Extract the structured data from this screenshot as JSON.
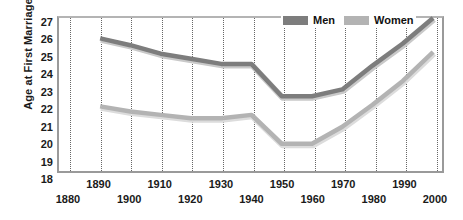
{
  "chart_data": {
    "type": "line",
    "title": "",
    "xlabel": "",
    "ylabel": "Age at First Marriage",
    "xlim": [
      1880,
      2000
    ],
    "ylim": [
      18,
      27
    ],
    "grid": "vertical-dotted",
    "legend_position": "top-right",
    "x": [
      1890,
      1900,
      1910,
      1920,
      1930,
      1940,
      1950,
      1960,
      1970,
      1980,
      1990,
      2000
    ],
    "series": [
      {
        "name": "Men",
        "color": "#7d7d7d",
        "values": [
          25.8,
          25.4,
          24.9,
          24.6,
          24.3,
          24.3,
          22.4,
          22.4,
          22.8,
          24.2,
          25.5,
          27.0
        ]
      },
      {
        "name": "Women",
        "color": "#b3b3b3",
        "values": [
          21.8,
          21.5,
          21.3,
          21.1,
          21.1,
          21.3,
          19.6,
          19.6,
          20.6,
          21.9,
          23.3,
          25.0
        ]
      }
    ],
    "y_ticks": [
      27,
      26,
      25,
      24,
      23,
      22,
      21,
      20,
      19,
      18
    ],
    "x_ticks": [
      1880,
      1890,
      1900,
      1910,
      1920,
      1930,
      1940,
      1950,
      1960,
      1970,
      1980,
      1990,
      2000
    ]
  },
  "axes": {
    "y_title": "Age at First Marriage",
    "y_tick_labels": [
      "27",
      "26",
      "25",
      "24",
      "23",
      "22",
      "21",
      "20",
      "19",
      "18"
    ],
    "x_tick_labels": [
      "1880",
      "1890",
      "1900",
      "1910",
      "1920",
      "1930",
      "1940",
      "1950",
      "1960",
      "1970",
      "1980",
      "1990",
      "2000"
    ]
  },
  "legend": {
    "items": [
      {
        "label": "Men",
        "color": "#7d7d7d"
      },
      {
        "label": "Women",
        "color": "#b3b3b3"
      }
    ]
  },
  "colors": {
    "men_line": "#7d7d7d",
    "women_line": "#b3b3b3",
    "men_shadow": "#c9c9c9",
    "women_shadow": "#dcdcdc",
    "gridline": "#666666",
    "frame": "#9a9a9a",
    "text": "#1a1a1a",
    "background": "#ffffff"
  }
}
